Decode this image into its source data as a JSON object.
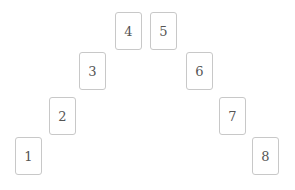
{
  "diagram": {
    "type": "card-spread-arch",
    "cards": [
      {
        "label": "1",
        "x": 15,
        "y": 137
      },
      {
        "label": "2",
        "x": 49,
        "y": 97
      },
      {
        "label": "3",
        "x": 79,
        "y": 52
      },
      {
        "label": "4",
        "x": 115,
        "y": 12
      },
      {
        "label": "5",
        "x": 150,
        "y": 12
      },
      {
        "label": "6",
        "x": 186,
        "y": 52
      },
      {
        "label": "7",
        "x": 219,
        "y": 97
      },
      {
        "label": "8",
        "x": 252,
        "y": 137
      }
    ],
    "colors": {
      "card_border": "#c8c8c8",
      "card_fill": "#ffffff",
      "text": "#555555",
      "background": "#ffffff"
    }
  }
}
